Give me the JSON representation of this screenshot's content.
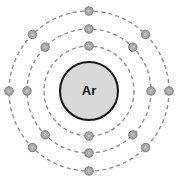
{
  "diagram": {
    "type": "bohr-atom-model",
    "nucleus": {
      "symbol": "Ar",
      "element_name": "Argon",
      "cx": 89,
      "cy": 91,
      "r": 29,
      "fill": "#d9d9d9",
      "stroke": "#1a1a1a"
    },
    "background": "#ffffff",
    "shell_stroke": "#8f8f8f",
    "electron_fill": "#a8a8a8",
    "electron_stroke": "#7a7a7a",
    "electron_radius": 4.2,
    "total_electrons": 18,
    "shells": [
      {
        "index": 1,
        "name": "K",
        "radius": 45,
        "electron_count": 2,
        "electron_angles": [
          270,
          90
        ]
      },
      {
        "index": 2,
        "name": "L",
        "radius": 62,
        "electron_count": 8,
        "electron_angles": [
          270,
          315,
          0,
          45,
          90,
          135,
          180,
          225
        ]
      },
      {
        "index": 3,
        "name": "M",
        "radius": 80,
        "electron_count": 8,
        "electron_angles": [
          270,
          315,
          0,
          45,
          90,
          135,
          180,
          225
        ]
      }
    ]
  }
}
